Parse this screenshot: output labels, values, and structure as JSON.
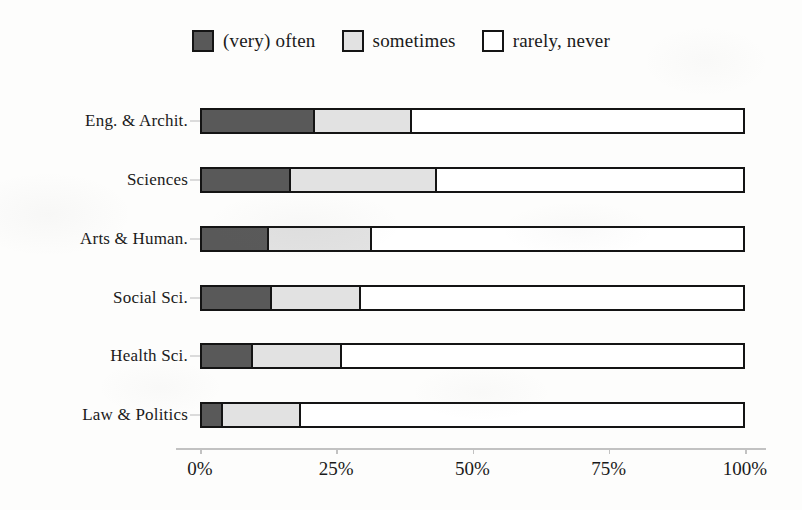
{
  "chart_data": {
    "type": "bar",
    "orientation": "horizontal",
    "stacked": true,
    "normalized": true,
    "title": "",
    "subtitle": "",
    "xlabel": "",
    "ylabel": "",
    "xlim": [
      0,
      100
    ],
    "xticks": [
      0,
      25,
      50,
      75,
      100
    ],
    "xtick_labels": [
      "0%",
      "25%",
      "50%",
      "75%",
      "100%"
    ],
    "grid": false,
    "legend_position": "top-center",
    "categories": [
      "Eng. & Archit.",
      "Sciences",
      "Arts & Human.",
      "Social Sci.",
      "Health Sci.",
      "Law & Politics"
    ],
    "series": [
      {
        "name": "(very) often",
        "color": "#595959",
        "values": [
          20.5,
          16.0,
          12.0,
          12.5,
          9.0,
          3.5
        ]
      },
      {
        "name": "sometimes",
        "color": "#e2e2e2",
        "values": [
          18.0,
          27.0,
          19.0,
          16.5,
          16.5,
          14.5
        ]
      },
      {
        "name": "rarely, never",
        "color": "#ffffff",
        "values": [
          61.5,
          57.0,
          69.0,
          71.0,
          74.5,
          82.0
        ]
      }
    ]
  },
  "legend": {
    "items": [
      {
        "label": "(very) often",
        "color": "#595959"
      },
      {
        "label": "sometimes",
        "color": "#e2e2e2"
      },
      {
        "label": "rarely, never",
        "color": "#ffffff"
      }
    ]
  },
  "axis": {
    "tick_labels": [
      "0%",
      "25%",
      "50%",
      "75%",
      "100%"
    ]
  },
  "colors": {
    "background": "#fdfdfc",
    "stroke": "#141414",
    "axis": "#c2c2c2",
    "text": "#1a1a1a"
  }
}
